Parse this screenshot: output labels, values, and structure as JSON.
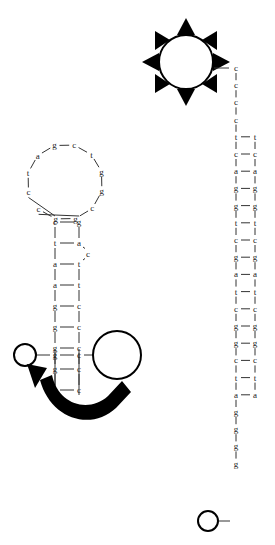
{
  "figure": {
    "title": "",
    "background_color": "#ffffff",
    "base_color": "#1a1a1a",
    "bond_color": "#333333",
    "marker_color": "#000000"
  },
  "chart_data": {
    "type": "diagram",
    "title": "",
    "structures": [
      {
        "id": "hairpin",
        "name": "stem-loop-hairpin",
        "loop": {
          "name": "terminal-loop",
          "bases": [
            "c",
            "t",
            "a",
            "g",
            "c",
            "t",
            "g",
            "g",
            "c",
            "g",
            "g",
            "c"
          ],
          "count": 12
        },
        "stem_pairs": [
          {
            "left": "c",
            "right": "g"
          },
          {
            "left": "t",
            "right": "a"
          },
          {
            "left": "a",
            "right": "t"
          },
          {
            "left": "a",
            "right": "t"
          },
          {
            "left": "g",
            "right": "c"
          },
          {
            "left": "g",
            "right": "c"
          },
          {
            "left": "g",
            "right": "c"
          },
          {
            "left": "g",
            "right": "c"
          },
          {
            "left": "g",
            "right": "c"
          }
        ],
        "bulge": {
          "base": "c",
          "side": "right"
        },
        "terminal_left_base": "g",
        "terminal_right_base": "c"
      },
      {
        "id": "duplex",
        "name": "right-duplex-ladder",
        "single_strand_top": [
          "c",
          "c",
          "c",
          "c"
        ],
        "pairs": [
          {
            "left": "t",
            "right": "t"
          },
          {
            "left": "c",
            "right": "c"
          },
          {
            "left": "a",
            "right": "a"
          },
          {
            "left": "g",
            "right": "g"
          },
          {
            "left": "g",
            "right": "g"
          },
          {
            "left": "t",
            "right": "t"
          },
          {
            "left": "c",
            "right": "c"
          },
          {
            "left": "g",
            "right": "g"
          },
          {
            "left": "a",
            "right": "a"
          },
          {
            "left": "t",
            "right": "t"
          },
          {
            "left": "c",
            "right": "c"
          },
          {
            "left": "g",
            "right": "g"
          },
          {
            "left": "g",
            "right": "g"
          },
          {
            "left": "c",
            "right": "c"
          },
          {
            "left": "t",
            "right": "t"
          },
          {
            "left": "a",
            "right": "a"
          }
        ],
        "single_strand_bottom": [
          "g",
          "g",
          "g",
          "g"
        ]
      }
    ],
    "markers": [
      {
        "id": "sun",
        "name": "sun-burst-marker",
        "shape": "circle-with-8-triangular-rays",
        "position": "top-right",
        "attached_to": "duplex-top"
      },
      {
        "id": "large-circle",
        "name": "large-circle-marker",
        "shape": "circle",
        "position": "bottom-left-center",
        "attached_to": "hairpin-right-terminus"
      },
      {
        "id": "small-circle-left",
        "name": "small-circle-marker-left",
        "shape": "circle",
        "position": "bottom-left",
        "attached_to": "hairpin-left-terminus"
      },
      {
        "id": "small-circle-bottom",
        "name": "small-circle-marker-bottom",
        "shape": "circle",
        "position": "bottom-right",
        "attached_to": "duplex-bottom"
      }
    ],
    "arrow": {
      "id": "transition-arrow",
      "name": "curved-transition-arrow",
      "direction": "clockwise-right-to-left",
      "head": "left-up",
      "style": "thick-curved-solid"
    }
  }
}
